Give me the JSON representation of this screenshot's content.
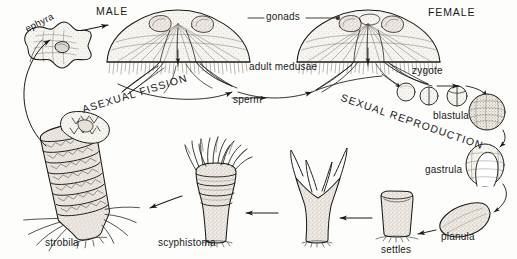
{
  "figure": {
    "background_color": "#fdfdfb",
    "ink_color": "#1a1a1a",
    "fill_tone": "#ded9d0",
    "width": 517,
    "height": 259
  },
  "labels": {
    "ephyra": "ephyra",
    "male": "MALE",
    "gonads": "gonads",
    "female": "FEMALE",
    "adult_medusae": "adult medusae",
    "sperm": "sperm",
    "zygote": "zygote",
    "blastula": "blastula",
    "gastrula": "gastrula",
    "planula": "planula",
    "settles": "settles",
    "scyphistoma": "scyphistoma",
    "strobila": "strobila",
    "asexual_fission": "ASEXUAL FISSION",
    "sexual_reproduction": "SEXUAL REPRODUCTION"
  },
  "stages": [
    {
      "key": "ephyra",
      "label": "ephyra",
      "phase": "asexual",
      "order": 1
    },
    {
      "key": "male_medusa",
      "label": "MALE",
      "phase": "adult",
      "order": 2
    },
    {
      "key": "female_medusa",
      "label": "FEMALE",
      "phase": "adult",
      "order": 3
    },
    {
      "key": "zygote",
      "label": "zygote",
      "phase": "sexual",
      "order": 4
    },
    {
      "key": "blastula",
      "label": "blastula",
      "phase": "sexual",
      "order": 5
    },
    {
      "key": "gastrula",
      "label": "gastrula",
      "phase": "sexual",
      "order": 6
    },
    {
      "key": "planula",
      "label": "planula",
      "phase": "sexual",
      "order": 7
    },
    {
      "key": "settles",
      "label": "settles",
      "phase": "sexual",
      "order": 8
    },
    {
      "key": "scyphistoma",
      "label": "scyphistoma",
      "phase": "asexual",
      "order": 9
    },
    {
      "key": "strobila",
      "label": "strobila",
      "phase": "asexual",
      "order": 10
    }
  ],
  "annotations": {
    "gonads_callout": "gonads",
    "adult_stage": "adult medusae",
    "gamete": "sperm",
    "process_left": "ASEXUAL FISSION",
    "process_right": "SEXUAL REPRODUCTION"
  }
}
